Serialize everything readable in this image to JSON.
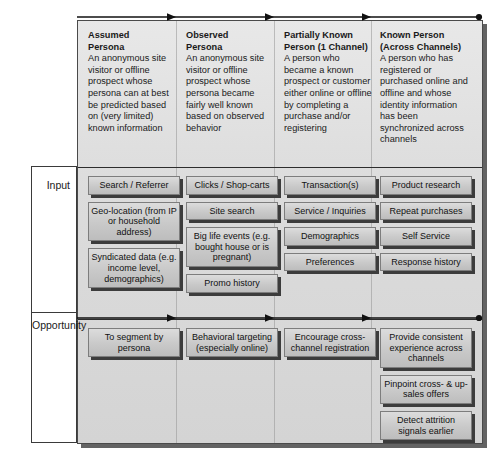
{
  "diagram": {
    "row_labels": {
      "input": "Input",
      "opportunity": "Opportunity"
    },
    "arrow_rail": {
      "icon": "right-arrow-rail",
      "segments": 3,
      "endpoint_icon": "dot-endpoint"
    },
    "columns": [
      {
        "id": "assumed-persona",
        "header_title": "Assumed\nPersona",
        "header_title_line1": "Assumed",
        "header_title_line2": "Persona",
        "header_body": "An anonymous site visitor or offline prospect whose persona can at best be predicted based on (very limited) known information",
        "input": [
          "Search / Referrer",
          "Geo-location (from IP or household address)",
          "Syndicated data (e.g. income level, demographics)"
        ],
        "opportunity": [
          "To segment by persona"
        ]
      },
      {
        "id": "observed-persona",
        "header_title_line1": "Observed",
        "header_title_line2": "Persona",
        "header_body": "An anonymous site visitor or offline prospect whose persona became fairly well known based on observed behavior",
        "input": [
          "Clicks / Shop-carts",
          "Site search",
          "Big life events (e.g. bought house or is pregnant)",
          "Promo history"
        ],
        "opportunity": [
          "Behavioral targeting (especially online)"
        ]
      },
      {
        "id": "partially-known-person",
        "header_title_line1": "Partially Known",
        "header_title_line2": "Person (1 Channel)",
        "header_body": "A person who became a known prospect or customer either online or offline by completing a purchase and/or registering",
        "input": [
          "Transaction(s)",
          "Service / Inquiries",
          "Demographics",
          "Preferences"
        ],
        "opportunity": [
          "Encourage cross-channel registration"
        ]
      },
      {
        "id": "known-person-across-channels",
        "header_title_line1": "Known Person",
        "header_title_line2": "(Across Channels)",
        "header_body": "A person who has registered or purchased online and offline and whose identity information has been synchronized across channels",
        "input": [
          "Product research",
          "Repeat purchases",
          "Self Service",
          "Response history"
        ],
        "opportunity": [
          "Provide consistent experience across channels",
          "Pinpoint cross- & up-sales offers",
          "Detect attrition signals earlier"
        ]
      }
    ],
    "colors": {
      "panel_bg": "#dcdcdc",
      "box_bg": "#c9c9c9",
      "box_border": "#7d7d7d",
      "shadow": "#3c3c3c",
      "text": "#111111",
      "frame": "#3a3a3a"
    }
  }
}
